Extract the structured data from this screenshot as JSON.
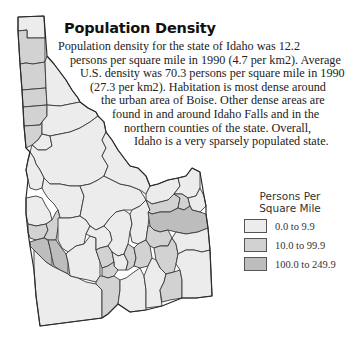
{
  "title": "Population Density",
  "paragraph": [
    "Population density for the state of Idaho was 12.2",
    "persons per square mile in 1990 (4.7 per km2). Average",
    "U.S. density was 70.3 persons per square mile in 1990",
    "(27.3 per km2). Habitation is most dense around",
    "the urban area of Boise. Other dense areas are",
    "found in and around Idaho Falls and in the",
    "northern counties of the state. Overall,",
    "Idaho is a very sparsely populated state."
  ],
  "paragraph_indents": [
    30,
    35,
    42,
    58,
    62,
    73,
    84,
    108
  ],
  "legend": {
    "title_line1": "Persons Per",
    "title_line2": "Square Mile",
    "items": [
      {
        "label": "0.0 to 9.9",
        "color": "#ececec"
      },
      {
        "label": "10.0 to 99.9",
        "color": "#d2d2d2"
      },
      {
        "label": "100.0 to 249.9",
        "color": "#bdbdbd"
      }
    ]
  },
  "colors": {
    "low": "#ececec",
    "mid": "#d2d2d2",
    "high": "#bdbdbd",
    "border": "#3a3a3a"
  }
}
